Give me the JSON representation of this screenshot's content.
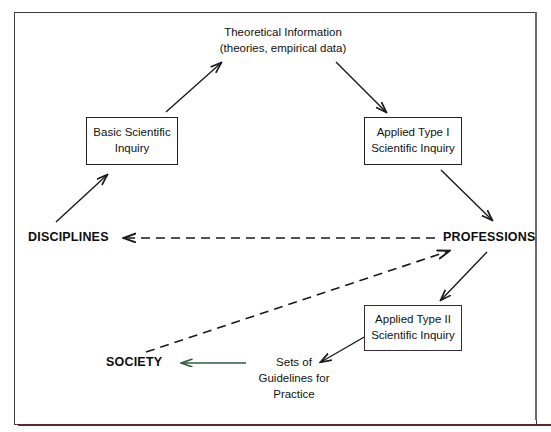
{
  "diagram": {
    "title_text": "Theoretical Information",
    "colors": {
      "frame": "#3b3b3b",
      "frame_bottom_accent": "#5a2a2a",
      "arrow": "#1a1a1a",
      "dashed_arrow": "#1a1a1a",
      "green_arrow": "#2f5d3f",
      "box_border": "#222222",
      "double_box_border": "#3a2a3a"
    },
    "labels": {
      "theoretical_info": {
        "line1": "Theoretical Information",
        "line2": "(theories, empirical data)"
      },
      "basic_inquiry": {
        "line1": "Basic Scientific",
        "line2": "Inquiry"
      },
      "applied_type_1": {
        "line1": "Applied Type I",
        "line2": "Scientific Inquiry"
      },
      "applied_type_2": {
        "line1": "Applied Type II",
        "line2": "Scientific Inquiry"
      },
      "guidelines": {
        "line1": "Sets of",
        "line2": "Guidelines for",
        "line3": "Practice"
      },
      "disciplines": "DISCIPLINES",
      "professions": "PROFESSIONS",
      "society": "SOCIETY"
    },
    "connectors": [
      {
        "name": "basic-inquiry-to-theoretical-information",
        "style": "solid",
        "from": "Basic Scientific Inquiry",
        "to": "Theoretical Information"
      },
      {
        "name": "theoretical-information-to-applied-type-1",
        "style": "solid",
        "from": "Theoretical Information",
        "to": "Applied Type I Scientific Inquiry"
      },
      {
        "name": "disciplines-to-basic-inquiry",
        "style": "solid",
        "from": "DISCIPLINES",
        "to": "Basic Scientific Inquiry"
      },
      {
        "name": "applied-type-1-to-professions",
        "style": "solid",
        "from": "Applied Type I Scientific Inquiry",
        "to": "PROFESSIONS"
      },
      {
        "name": "professions-to-disciplines",
        "style": "dashed",
        "from": "PROFESSIONS",
        "to": "DISCIPLINES"
      },
      {
        "name": "professions-to-applied-type-2",
        "style": "solid",
        "from": "PROFESSIONS",
        "to": "Applied Type II Scientific Inquiry"
      },
      {
        "name": "applied-type-2-to-guidelines",
        "style": "solid",
        "from": "Applied Type II Scientific Inquiry",
        "to": "Sets of Guidelines for Practice"
      },
      {
        "name": "guidelines-to-society",
        "style": "solid-green",
        "from": "Sets of Guidelines for Practice",
        "to": "SOCIETY"
      },
      {
        "name": "society-to-professions",
        "style": "dashed",
        "from": "SOCIETY",
        "to": "PROFESSIONS"
      }
    ]
  }
}
